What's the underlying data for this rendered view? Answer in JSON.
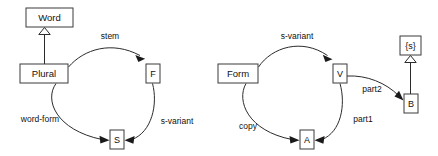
{
  "diagram": {
    "type": "uml-object-graph",
    "background_color": "#ffffff",
    "stroke_color": "#2b2b2b",
    "text_color": "#111111",
    "panels": [
      {
        "id": "left-panel",
        "name": "plural-word-panel",
        "nodes": [
          {
            "id": "word",
            "label": "Word",
            "shape": "rectangle",
            "x": 26,
            "y": 8,
            "w": 47,
            "h": 19
          },
          {
            "id": "plural",
            "label": "Plural",
            "shape": "rectangle",
            "x": 20,
            "y": 64,
            "w": 48,
            "h": 19
          },
          {
            "id": "f",
            "label": "F",
            "shape": "rectangle",
            "x": 146,
            "y": 64,
            "w": 14,
            "h": 19
          },
          {
            "id": "s",
            "label": "S",
            "shape": "rectangle",
            "x": 110,
            "y": 130,
            "w": 14,
            "h": 19
          }
        ],
        "generalizations": [
          {
            "id": "gen-plural-word",
            "from": "plural",
            "to": "word",
            "arrow": "hollow-triangle"
          }
        ],
        "edges": [
          {
            "id": "edge-stem",
            "label": "stem",
            "from": "plural",
            "to": "f",
            "arrow": "filled-arrow"
          },
          {
            "id": "edge-word-form",
            "label": "word-form",
            "from": "plural",
            "to": "s",
            "arrow": "filled-arrow"
          },
          {
            "id": "edge-s-variant",
            "label": "s-variant",
            "from": "f",
            "to": "s",
            "arrow": "filled-arrow"
          }
        ]
      },
      {
        "id": "right-panel",
        "name": "form-variant-panel",
        "nodes": [
          {
            "id": "form",
            "label": "Form",
            "shape": "rectangle",
            "x": 218,
            "y": 64,
            "w": 40,
            "h": 19
          },
          {
            "id": "v",
            "label": "V",
            "shape": "rectangle",
            "x": 333,
            "y": 64,
            "w": 14,
            "h": 19
          },
          {
            "id": "a",
            "label": "A",
            "shape": "rectangle",
            "x": 300,
            "y": 130,
            "w": 14,
            "h": 19
          },
          {
            "id": "b",
            "label": "B",
            "shape": "rectangle",
            "x": 405,
            "y": 94,
            "w": 14,
            "h": 19
          },
          {
            "id": "s-set",
            "label": "{s}",
            "shape": "rectangle",
            "x": 400,
            "y": 36,
            "w": 21,
            "h": 19
          }
        ],
        "generalizations": [
          {
            "id": "gen-b-sset",
            "from": "b",
            "to": "s-set",
            "arrow": "hollow-triangle"
          }
        ],
        "edges": [
          {
            "id": "edge-s-variant-2",
            "label": "s-variant",
            "from": "form",
            "to": "v",
            "arrow": "filled-arrow"
          },
          {
            "id": "edge-copy",
            "label": "copy",
            "from": "form",
            "to": "a",
            "arrow": "filled-arrow"
          },
          {
            "id": "edge-part1",
            "label": "part1",
            "from": "v",
            "to": "a",
            "arrow": "filled-arrow"
          },
          {
            "id": "edge-part2",
            "label": "part2",
            "from": "v",
            "to": "b",
            "arrow": "filled-arrow"
          }
        ]
      }
    ],
    "labels": {
      "word": "Word",
      "plural": "Plural",
      "f": "F",
      "s": "S",
      "form": "Form",
      "v": "V",
      "a": "A",
      "b": "B",
      "s_set": "{s}",
      "stem": "stem",
      "word_form": "word-form",
      "s_variant_left": "s-variant",
      "s_variant_right": "s-variant",
      "copy": "copy",
      "part1": "part1",
      "part2": "part2"
    }
  }
}
